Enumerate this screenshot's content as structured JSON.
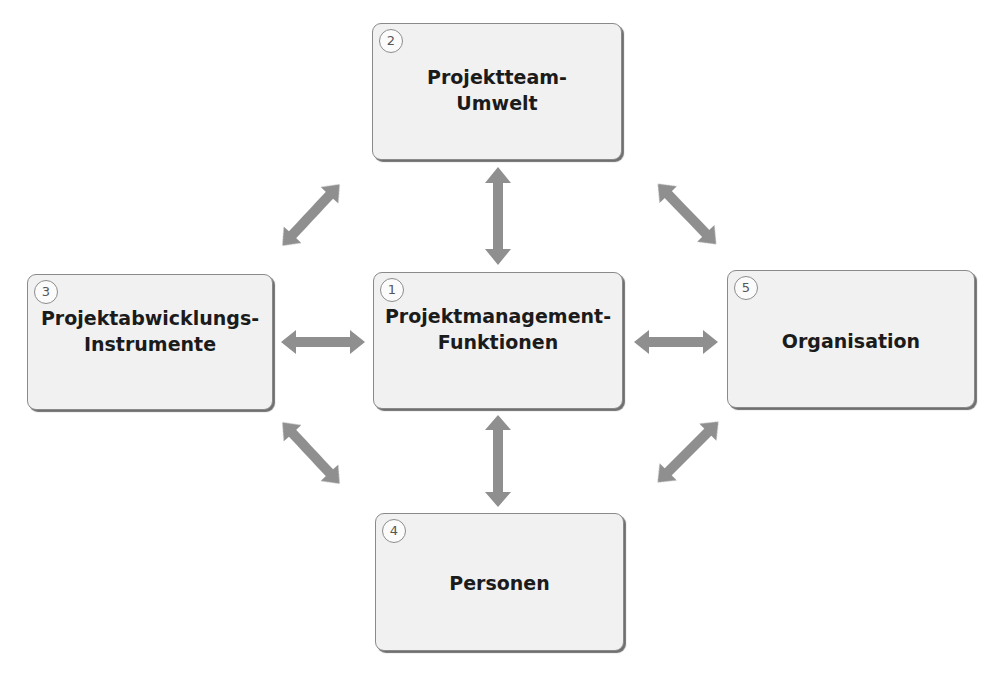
{
  "diagram": {
    "nodes": [
      {
        "id": 1,
        "number": "1",
        "line1": "Projektmanagement-",
        "line2": "Funktionen"
      },
      {
        "id": 2,
        "number": "2",
        "line1": "Projektteam-",
        "line2": "Umwelt"
      },
      {
        "id": 3,
        "number": "3",
        "line1": "Projektabwicklungs-",
        "line2": "Instrumente"
      },
      {
        "id": 4,
        "number": "4",
        "line1": "Personen",
        "line2": ""
      },
      {
        "id": 5,
        "number": "5",
        "line1": "Organisation",
        "line2": ""
      }
    ],
    "edges": [
      {
        "from": 1,
        "to": 2,
        "type": "bidirectional"
      },
      {
        "from": 1,
        "to": 3,
        "type": "bidirectional"
      },
      {
        "from": 1,
        "to": 4,
        "type": "bidirectional"
      },
      {
        "from": 1,
        "to": 5,
        "type": "bidirectional"
      },
      {
        "from": 2,
        "to": 3,
        "type": "bidirectional"
      },
      {
        "from": 2,
        "to": 5,
        "type": "bidirectional"
      },
      {
        "from": 3,
        "to": 4,
        "type": "bidirectional"
      },
      {
        "from": 4,
        "to": 5,
        "type": "bidirectional"
      }
    ],
    "colors": {
      "box_fill": "#f1f1f1",
      "box_border": "#8a8a8a",
      "arrow": "#8f8f8f",
      "text": "#1b1b1b"
    }
  }
}
